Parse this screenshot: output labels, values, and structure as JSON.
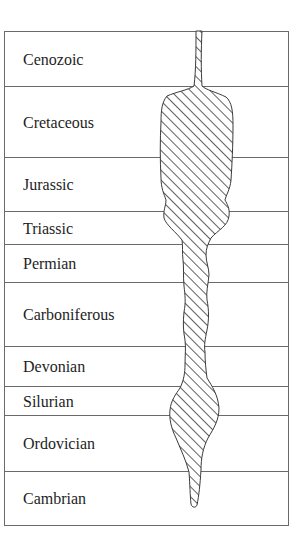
{
  "diagram": {
    "type": "spindle-diagram",
    "frame": {
      "x": 4,
      "y": 31,
      "width": 284,
      "height": 494
    },
    "colors": {
      "line": "#6a6a6a",
      "text": "#1e1e1e",
      "hatch": "#3a3a3a",
      "background": "#ffffff"
    },
    "periods": [
      {
        "label": "Cenozoic",
        "top": 31,
        "bottom": 86
      },
      {
        "label": "Cretaceous",
        "top": 86,
        "bottom": 157
      },
      {
        "label": "Jurassic",
        "top": 157,
        "bottom": 211
      },
      {
        "label": "Triassic",
        "top": 211,
        "bottom": 244
      },
      {
        "label": "Permian",
        "top": 244,
        "bottom": 282
      },
      {
        "label": "Carboniferous",
        "top": 282,
        "bottom": 346
      },
      {
        "label": "Devonian",
        "top": 346,
        "bottom": 386
      },
      {
        "label": "Silurian",
        "top": 386,
        "bottom": 415
      },
      {
        "label": "Ordovician",
        "top": 415,
        "bottom": 471
      },
      {
        "label": "Cambrian",
        "top": 471,
        "bottom": 525
      }
    ]
  }
}
